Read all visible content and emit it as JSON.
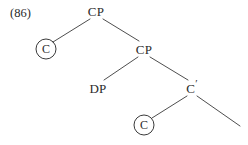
{
  "figure": {
    "example_number": "(86)",
    "background_color": "#ffffff",
    "line_color": "#3a3a3a",
    "text_color": "#2b2b2b",
    "width": 248,
    "height": 145
  },
  "tree": {
    "type": "syntax-tree",
    "nodes": [
      {
        "id": "cp-root",
        "label": "CP",
        "circled": false,
        "x": 96,
        "y": 11
      },
      {
        "id": "c-left",
        "label": "C",
        "circled": true,
        "x": 46,
        "y": 49
      },
      {
        "id": "cp-second",
        "label": "CP",
        "circled": false,
        "x": 144,
        "y": 49
      },
      {
        "id": "dp",
        "label": "DP",
        "circled": false,
        "x": 98,
        "y": 88
      },
      {
        "id": "c-bar",
        "label": "C",
        "prime": "′",
        "circled": false,
        "x": 192,
        "y": 88
      },
      {
        "id": "c-bottom",
        "label": "C",
        "circled": true,
        "x": 144,
        "y": 125
      }
    ],
    "branches": [
      {
        "id": "root-to-c-left",
        "from": "cp-root",
        "to": "c-left",
        "x1": 90,
        "y1": 19,
        "x2": 53,
        "y2": 42
      },
      {
        "id": "root-to-cp-second",
        "from": "cp-root",
        "to": "cp-second",
        "x1": 103,
        "y1": 19,
        "x2": 139,
        "y2": 41
      },
      {
        "id": "cp-to-dp",
        "from": "cp-second",
        "to": "dp",
        "x1": 138,
        "y1": 57,
        "x2": 104,
        "y2": 80
      },
      {
        "id": "cp-to-cbar",
        "from": "cp-second",
        "to": "c-bar",
        "x1": 150,
        "y1": 57,
        "x2": 188,
        "y2": 80
      },
      {
        "id": "cbar-to-c-bottom",
        "from": "c-bar",
        "to": "c-bottom",
        "x1": 187,
        "y1": 96,
        "x2": 152,
        "y2": 118
      },
      {
        "id": "cbar-to-trace",
        "from": "c-bar",
        "to": null,
        "x1": 197,
        "y1": 96,
        "x2": 240,
        "y2": 126
      }
    ]
  }
}
